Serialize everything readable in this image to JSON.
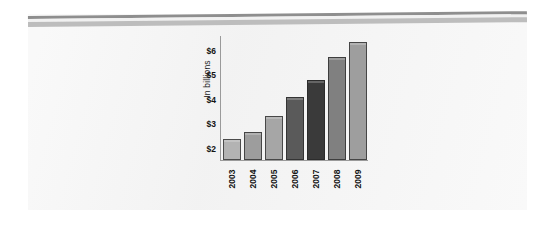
{
  "page": {
    "background_color": "#ffffff",
    "panel_color": "#f3f3f3"
  },
  "decoration": {
    "rule_dark_color": "#8e8e8e",
    "rule_light_color": "#bdbdbd"
  },
  "chart_data": {
    "type": "bar",
    "title": "",
    "subtitle": "",
    "xlabel": "",
    "ylabel": "In billions",
    "categories": [
      "2003",
      "2004",
      "2005",
      "2006",
      "2007",
      "2008",
      "2009"
    ],
    "values": [
      2.4,
      2.7,
      3.35,
      4.1,
      4.8,
      5.75,
      6.35
    ],
    "ytick_labels": [
      "$2",
      "$3",
      "$4",
      "$5",
      "$6"
    ],
    "ytick_values": [
      2,
      3,
      4,
      5,
      6
    ],
    "ylim": [
      1.55,
      6.6
    ],
    "grid": false,
    "legend": "none",
    "bar_colors": [
      "#b3b3b3",
      "#9d9d9d",
      "#a6a6a6",
      "#5a5a5a",
      "#3a3a3a",
      "#808080",
      "#9e9e9e"
    ],
    "bar_outline_color": "#282828",
    "axis_color": "#9a9a9a",
    "tick_text_color": "#141414"
  }
}
